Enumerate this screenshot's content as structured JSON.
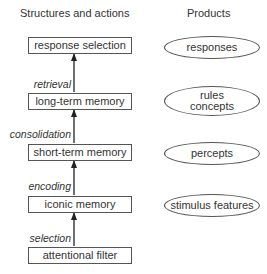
{
  "diagram": {
    "headers": {
      "left": "Structures and actions",
      "right": "Products"
    },
    "structures": [
      {
        "id": "response-selection",
        "label": "response selection"
      },
      {
        "id": "long-term-memory",
        "label": "long-term memory"
      },
      {
        "id": "short-term-memory",
        "label": "short-term memory"
      },
      {
        "id": "iconic-memory",
        "label": "iconic memory"
      },
      {
        "id": "attentional-filter",
        "label": "attentional filter"
      }
    ],
    "actions": [
      {
        "from": "long-term-memory",
        "to": "response-selection",
        "label": "retrieval"
      },
      {
        "from": "short-term-memory",
        "to": "long-term-memory",
        "label": "consolidation"
      },
      {
        "from": "iconic-memory",
        "to": "short-term-memory",
        "label": "encoding"
      },
      {
        "from": "attentional-filter",
        "to": "iconic-memory",
        "label": "selection"
      }
    ],
    "products": [
      {
        "id": "responses",
        "lines": [
          "responses"
        ]
      },
      {
        "id": "rules-concepts",
        "lines": [
          "rules",
          "concepts"
        ]
      },
      {
        "id": "percepts",
        "lines": [
          "percepts"
        ]
      },
      {
        "id": "stimulus-features",
        "lines": [
          "stimulus features"
        ]
      }
    ]
  }
}
